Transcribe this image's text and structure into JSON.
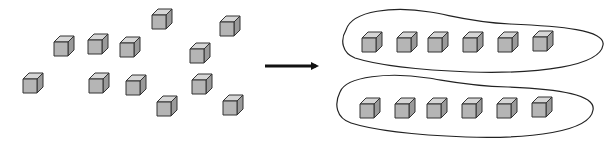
{
  "diagram": {
    "colors": {
      "background": "#ffffff",
      "cube_front": "#b5b5b5",
      "cube_top": "#d6d6d6",
      "cube_side": "#9a9a9a",
      "stroke": "#333333",
      "arrow": "#111111"
    },
    "left_cluster": {
      "label": "ungrouped-cubes",
      "count": 12,
      "cubes": [
        {
          "x": 54,
          "y": 42
        },
        {
          "x": 88,
          "y": 40
        },
        {
          "x": 120,
          "y": 43
        },
        {
          "x": 152,
          "y": 15
        },
        {
          "x": 220,
          "y": 22
        },
        {
          "x": 190,
          "y": 49
        },
        {
          "x": 23,
          "y": 79
        },
        {
          "x": 89,
          "y": 79
        },
        {
          "x": 126,
          "y": 81
        },
        {
          "x": 192,
          "y": 80
        },
        {
          "x": 157,
          "y": 102
        },
        {
          "x": 223,
          "y": 101
        }
      ]
    },
    "arrow": {
      "x1": 265,
      "y1": 66,
      "x2": 322,
      "y2": 66,
      "direction": "right"
    },
    "groups": [
      {
        "label": "group-1",
        "count": 6,
        "cubes": [
          {
            "x": 362,
            "y": 38
          },
          {
            "x": 397,
            "y": 38
          },
          {
            "x": 428,
            "y": 38
          },
          {
            "x": 463,
            "y": 38
          },
          {
            "x": 498,
            "y": 38
          },
          {
            "x": 533,
            "y": 37
          }
        ]
      },
      {
        "label": "group-2",
        "count": 6,
        "cubes": [
          {
            "x": 360,
            "y": 104
          },
          {
            "x": 395,
            "y": 104
          },
          {
            "x": 427,
            "y": 104
          },
          {
            "x": 462,
            "y": 104
          },
          {
            "x": 497,
            "y": 104
          },
          {
            "x": 532,
            "y": 103
          }
        ]
      }
    ]
  }
}
